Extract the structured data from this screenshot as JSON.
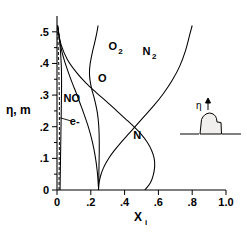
{
  "chart_data": {
    "type": "line",
    "title": "",
    "xlabel": "X_i",
    "ylabel": "η, m",
    "xlim": [
      0,
      1.0
    ],
    "ylim": [
      0,
      0.55
    ],
    "grid": false,
    "legend_position": "inline-curve-labels",
    "x_ticks": [
      0,
      0.2,
      0.4,
      0.6,
      0.8,
      1.0
    ],
    "x_tick_labels": [
      "0",
      ".2",
      ".4",
      ".6",
      ".8",
      "1.0"
    ],
    "y_ticks": [
      0,
      0.1,
      0.2,
      0.3,
      0.4,
      0.5
    ],
    "y_tick_labels": [
      "0",
      ".1",
      ".2",
      ".3",
      ".4",
      ".5"
    ],
    "y_minor_ticks": [
      0.05,
      0.15,
      0.25,
      0.35,
      0.45
    ],
    "series": [
      {
        "name": "N2",
        "label": "N₂",
        "style": "solid",
        "label_x": 0.53,
        "label_y": 0.44,
        "x": [
          0.245,
          0.248,
          0.258,
          0.275,
          0.3,
          0.335,
          0.378,
          0.425,
          0.47,
          0.52,
          0.575,
          0.63,
          0.68,
          0.725,
          0.76,
          0.785,
          0.8
        ],
        "y": [
          0.0,
          0.02,
          0.045,
          0.07,
          0.095,
          0.122,
          0.15,
          0.178,
          0.205,
          0.235,
          0.268,
          0.305,
          0.345,
          0.39,
          0.44,
          0.49,
          0.52
        ]
      },
      {
        "name": "N",
        "label": "N",
        "style": "solid",
        "label_x": 0.475,
        "label_y": 0.175,
        "x": [
          0.52,
          0.552,
          0.57,
          0.578,
          0.575,
          0.56,
          0.535,
          0.5,
          0.455,
          0.405,
          0.35,
          0.292,
          0.232,
          0.172,
          0.115,
          0.062,
          0.025,
          0.008,
          0.003
        ],
        "y": [
          0.0,
          0.022,
          0.048,
          0.075,
          0.1,
          0.125,
          0.15,
          0.175,
          0.2,
          0.225,
          0.252,
          0.28,
          0.308,
          0.338,
          0.372,
          0.412,
          0.458,
          0.5,
          0.52
        ]
      },
      {
        "name": "O2",
        "label": "O₂",
        "style": "solid",
        "label_x": 0.33,
        "label_y": 0.455,
        "x": [
          0.246,
          0.247,
          0.248,
          0.249,
          0.25,
          0.25,
          0.249,
          0.246,
          0.24,
          0.23,
          0.218,
          0.205,
          0.196,
          0.192,
          0.196,
          0.208,
          0.224,
          0.236,
          0.243
        ],
        "y": [
          0.0,
          0.03,
          0.06,
          0.09,
          0.12,
          0.15,
          0.18,
          0.21,
          0.24,
          0.268,
          0.295,
          0.32,
          0.345,
          0.37,
          0.398,
          0.432,
          0.468,
          0.498,
          0.52
        ]
      },
      {
        "name": "O",
        "label": "O",
        "style": "solid",
        "label_x": 0.268,
        "label_y": 0.355,
        "x": [
          0.245,
          0.238,
          0.225,
          0.208,
          0.188,
          0.163,
          0.138,
          0.115,
          0.094,
          0.075,
          0.058,
          0.042,
          0.028,
          0.017,
          0.009,
          0.004
        ],
        "y": [
          0.01,
          0.06,
          0.11,
          0.155,
          0.195,
          0.235,
          0.272,
          0.305,
          0.333,
          0.36,
          0.386,
          0.412,
          0.44,
          0.468,
          0.498,
          0.52
        ]
      },
      {
        "name": "NO",
        "label": "NO",
        "style": "solid",
        "label_x": 0.088,
        "label_y": 0.29,
        "x": [
          0.018,
          0.019,
          0.02,
          0.021,
          0.022,
          0.023,
          0.024,
          0.025,
          0.026,
          0.027,
          0.027,
          0.026,
          0.023,
          0.019,
          0.014,
          0.008,
          0.004
        ],
        "y": [
          0.0,
          0.035,
          0.07,
          0.105,
          0.14,
          0.175,
          0.21,
          0.245,
          0.28,
          0.315,
          0.35,
          0.385,
          0.418,
          0.45,
          0.48,
          0.505,
          0.52
        ]
      },
      {
        "name": "e-",
        "label": "e-",
        "style": "dashed",
        "label_x": 0.105,
        "label_y": 0.218,
        "x": [
          0.012,
          0.012,
          0.013,
          0.013,
          0.014,
          0.014,
          0.014,
          0.014,
          0.014,
          0.013,
          0.012,
          0.011,
          0.009,
          0.007,
          0.005,
          0.003
        ],
        "y": [
          0.0,
          0.035,
          0.07,
          0.105,
          0.14,
          0.175,
          0.21,
          0.245,
          0.28,
          0.315,
          0.35,
          0.385,
          0.42,
          0.455,
          0.49,
          0.518
        ]
      }
    ],
    "annotations": [
      {
        "name": "e-minus-leader",
        "from_x": 0.085,
        "from_y": 0.218,
        "to_x": 0.02,
        "to_y": 0.228
      }
    ]
  },
  "inset": {
    "label": "η",
    "arrow": "up-arrow-icon",
    "description": "blunt-body-silhouette"
  }
}
